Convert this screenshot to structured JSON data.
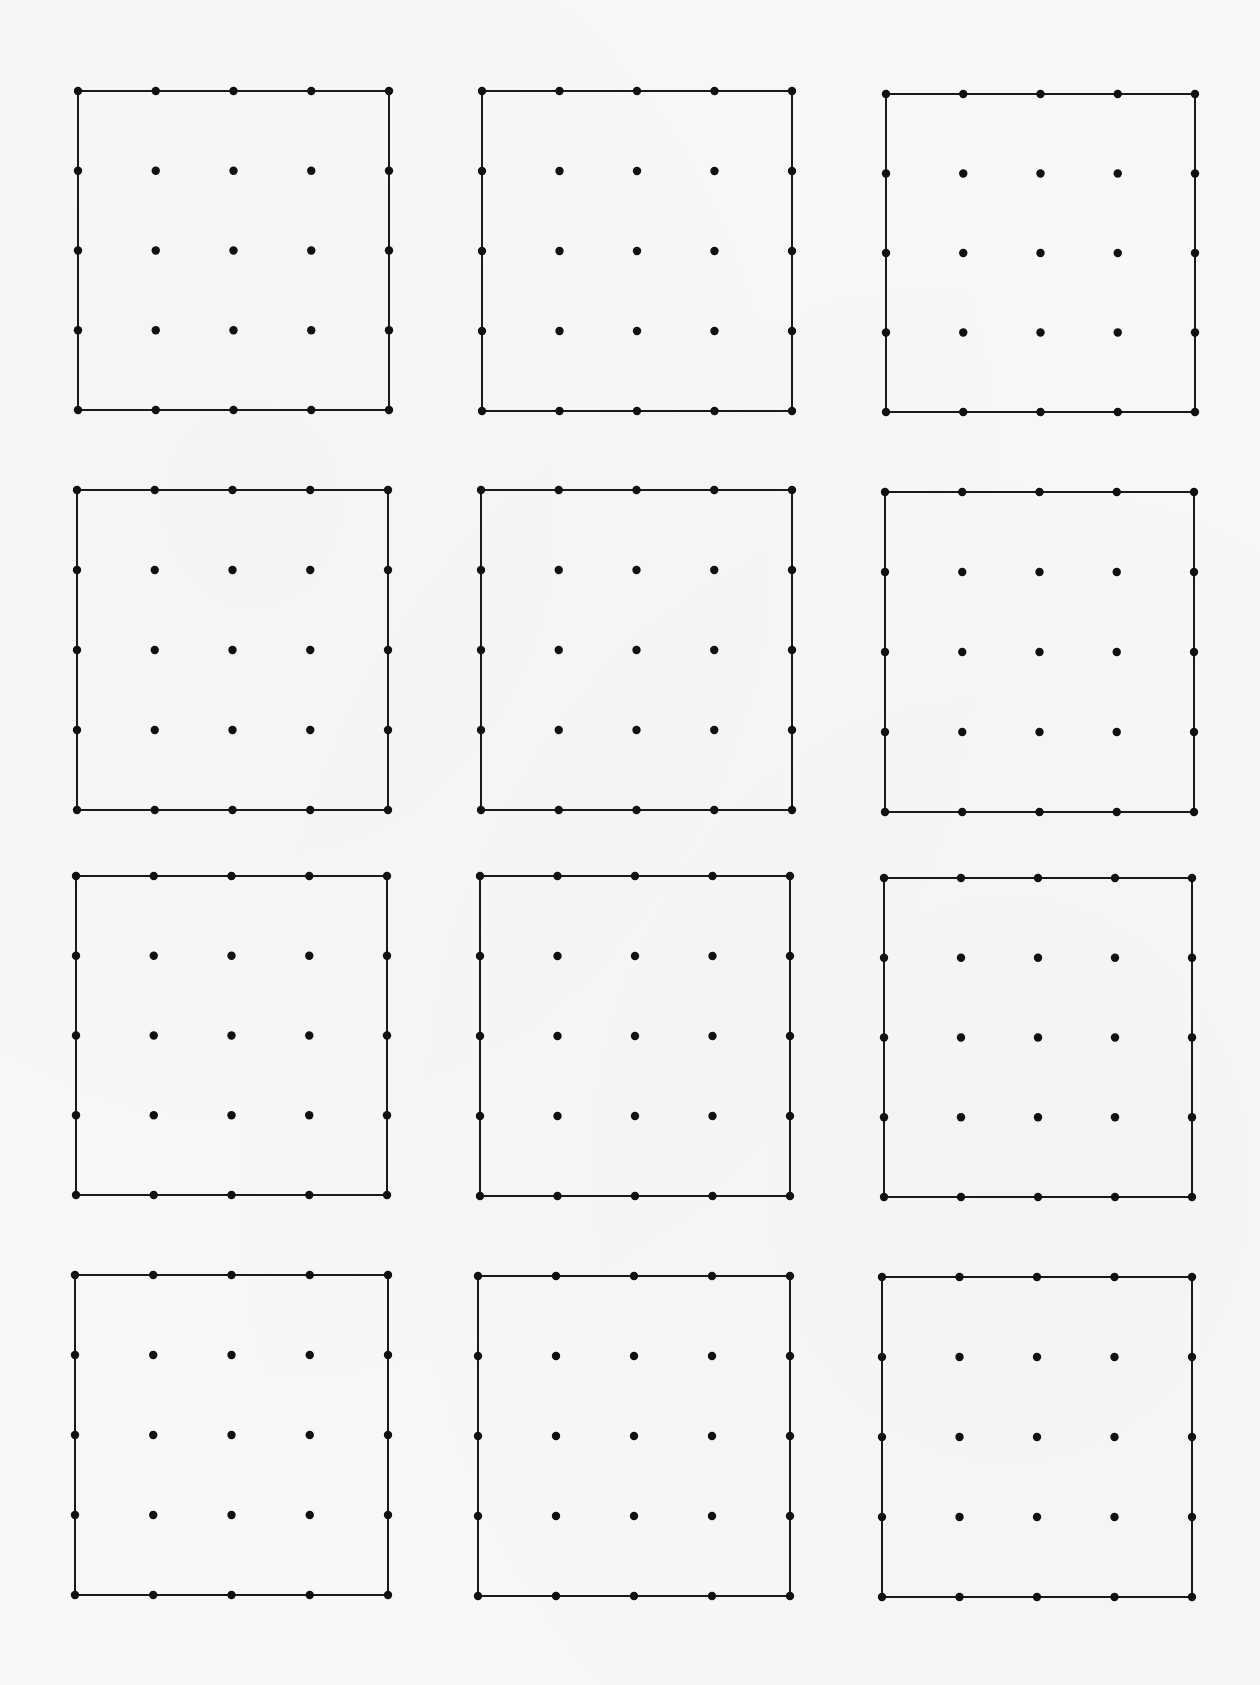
{
  "worksheet": {
    "type": "dot-grid geoboard worksheet",
    "rows": 4,
    "columns": 3,
    "dots_per_side": 5,
    "border_drawn": true,
    "colors": {
      "paper": "#f8f8f6",
      "ink": "#111111"
    },
    "grids": [
      {
        "id": "grid-r1-c1",
        "x": 78,
        "y": 91,
        "w": 311,
        "h": 319
      },
      {
        "id": "grid-r1-c2",
        "x": 482,
        "y": 91,
        "w": 310,
        "h": 320
      },
      {
        "id": "grid-r1-c3",
        "x": 886,
        "y": 94,
        "w": 309,
        "h": 318
      },
      {
        "id": "grid-r2-c1",
        "x": 77,
        "y": 490,
        "w": 311,
        "h": 320
      },
      {
        "id": "grid-r2-c2",
        "x": 481,
        "y": 490,
        "w": 311,
        "h": 320
      },
      {
        "id": "grid-r2-c3",
        "x": 885,
        "y": 492,
        "w": 309,
        "h": 320
      },
      {
        "id": "grid-r3-c1",
        "x": 76,
        "y": 876,
        "w": 311,
        "h": 319
      },
      {
        "id": "grid-r3-c2",
        "x": 480,
        "y": 876,
        "w": 310,
        "h": 320
      },
      {
        "id": "grid-r3-c3",
        "x": 884,
        "y": 878,
        "w": 308,
        "h": 319
      },
      {
        "id": "grid-r4-c1",
        "x": 75,
        "y": 1275,
        "w": 313,
        "h": 320
      },
      {
        "id": "grid-r4-c2",
        "x": 478,
        "y": 1276,
        "w": 312,
        "h": 320
      },
      {
        "id": "grid-r4-c3",
        "x": 882,
        "y": 1277,
        "w": 310,
        "h": 320
      }
    ]
  }
}
